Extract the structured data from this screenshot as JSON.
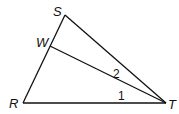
{
  "diagram": {
    "type": "triangle",
    "points": {
      "S": {
        "label": "S"
      },
      "W": {
        "label": "W"
      },
      "R": {
        "label": "R"
      },
      "T": {
        "label": "T"
      }
    },
    "angles": [
      {
        "label": "1",
        "between": "RT and WT"
      },
      {
        "label": "2",
        "between": "WT and ST"
      }
    ],
    "segments": [
      "RS",
      "ST",
      "RT",
      "WT"
    ]
  }
}
